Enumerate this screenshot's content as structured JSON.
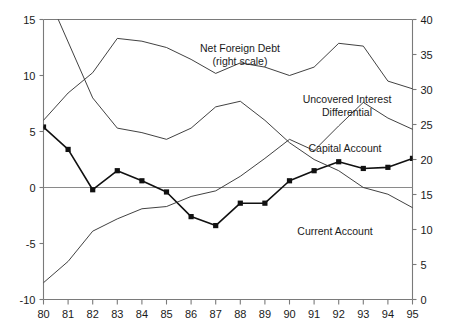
{
  "chart_data": {
    "type": "line",
    "title": "",
    "xlabel": "",
    "ylabel": "",
    "y2label": "",
    "grid": false,
    "legend_position": "inline-annotations",
    "categories": [
      "80",
      "81",
      "82",
      "83",
      "84",
      "85",
      "86",
      "87",
      "88",
      "89",
      "90",
      "91",
      "92",
      "93",
      "94",
      "95"
    ],
    "x_tick_labels": [
      "80",
      "81",
      "82",
      "83",
      "84",
      "85",
      "86",
      "87",
      "88",
      "89",
      "90",
      "91",
      "92",
      "93",
      "94",
      "95"
    ],
    "left_axis": {
      "label": "",
      "ylim": [
        -10,
        15
      ],
      "ticks": [
        -10,
        -5,
        0,
        5,
        10,
        15
      ],
      "tick_labels": [
        "-10",
        "-5",
        "0",
        "5",
        "10",
        "15"
      ]
    },
    "right_axis": {
      "label": "",
      "ylim": [
        0,
        40
      ],
      "ticks": [
        0,
        5,
        10,
        15,
        20,
        25,
        30,
        35,
        40
      ],
      "tick_labels": [
        "0",
        "5",
        "10",
        "15",
        "20",
        "25",
        "30",
        "35",
        "40"
      ]
    },
    "series": [
      {
        "name": "Capital Account",
        "axis": "left",
        "marker": "square",
        "values": [
          5.4,
          3.4,
          -0.2,
          1.5,
          0.6,
          -0.4,
          -2.6,
          -3.4,
          -1.4,
          -1.4,
          0.6,
          1.5,
          2.3,
          1.7,
          1.8,
          2.6
        ]
      },
      {
        "name": "Current Account",
        "axis": "left",
        "marker": "none",
        "values": [
          -8.5,
          -6.6,
          -3.9,
          -2.8,
          -1.9,
          -1.7,
          -0.8,
          -0.3,
          1.0,
          2.6,
          4.3,
          3.3,
          5.5,
          7.6,
          6.2,
          5.2
        ]
      },
      {
        "name": "Uncovered Interest Differential",
        "axis": "left",
        "marker": "none",
        "values": [
          18.0,
          13.0,
          8.0,
          5.3,
          4.9,
          4.3,
          5.3,
          7.2,
          7.7,
          6.0,
          4.0,
          2.5,
          1.5,
          0.0,
          -0.6,
          -1.8
        ]
      },
      {
        "name": "Net Foreign Debt",
        "axis": "right",
        "marker": "none",
        "values": [
          25.6,
          29.5,
          32.4,
          37.3,
          36.9,
          36.0,
          34.3,
          32.3,
          33.8,
          33.2,
          32.0,
          33.2,
          36.6,
          36.2,
          31.2,
          30.1
        ]
      }
    ],
    "annotations": [
      {
        "id": "net-foreign-debt",
        "text_lines": [
          "Net Foreign Debt",
          "(right scale)"
        ],
        "x": 240,
        "y": 52,
        "anchor": "middle"
      },
      {
        "id": "uncovered-interest-differential",
        "text_lines": [
          "Uncovered Interest",
          "Differential"
        ],
        "x": 347,
        "y": 103,
        "anchor": "middle"
      },
      {
        "id": "capital-account",
        "text_lines": [
          "Capital Account"
        ],
        "x": 345,
        "y": 152,
        "anchor": "middle"
      },
      {
        "id": "current-account",
        "text_lines": [
          "Current Account"
        ],
        "x": 335,
        "y": 235,
        "anchor": "middle"
      }
    ]
  },
  "colors": {
    "background": "#ffffff",
    "axis": "#7a7a7a",
    "thin_series": "#2b2b2b",
    "marked_series": "#111111",
    "text": "#1a1a1a"
  }
}
